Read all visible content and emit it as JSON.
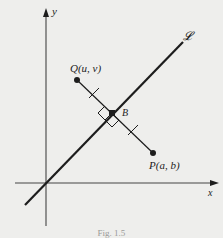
{
  "figure": {
    "caption": "Fig. 1.5",
    "colors": {
      "background": "#eeeeec",
      "ink": "#1d1d1d",
      "axis": "#444444"
    },
    "axes": {
      "x_label": "x",
      "y_label": "y"
    },
    "line": {
      "label": "𝓛",
      "from": [
        25,
        205
      ],
      "to": [
        183,
        42
      ]
    },
    "points": {
      "Q": {
        "label": "Q(u, v)",
        "pos": [
          77,
          80
        ]
      },
      "P": {
        "label": "P(a, b)",
        "pos": [
          153,
          153
        ]
      },
      "B": {
        "label": "B",
        "pos": [
          112,
          113
        ]
      }
    },
    "annotations": [
      "right-angle marker at B",
      "equal-length tick marks on QB and BP"
    ]
  }
}
